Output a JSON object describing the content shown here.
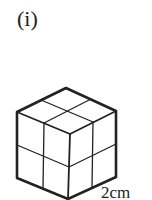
{
  "figure": {
    "part_label": "(i)",
    "dimension_label": "2cm",
    "shape": "cube-2x2x2",
    "stroke_color": "#222222"
  }
}
